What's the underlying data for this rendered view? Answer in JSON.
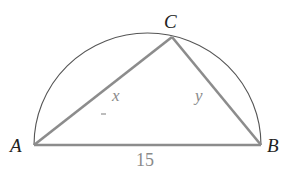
{
  "diagram": {
    "vertices": {
      "A": {
        "label": "A",
        "x": 34,
        "y": 145
      },
      "B": {
        "label": "B",
        "x": 261,
        "y": 145
      },
      "C": {
        "label": "C",
        "x": 172,
        "y": 37
      }
    },
    "sides": {
      "AC": {
        "label": "x"
      },
      "BC": {
        "label": "y"
      },
      "AB": {
        "label": "15"
      }
    },
    "tick_mark": "-",
    "colors": {
      "arc": "#555555",
      "triangle": "#8c8c8c",
      "vertex_label": "#222222",
      "side_label": "#8a8a8a",
      "background": "#ffffff"
    }
  }
}
